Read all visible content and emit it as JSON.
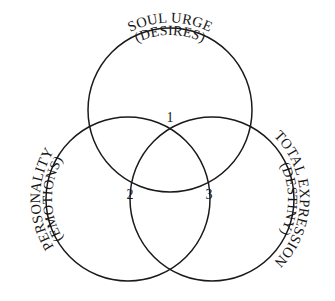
{
  "figure": {
    "background_color": "#ffffff",
    "stroke_color": "#1a1a1a",
    "text_color": "#161616"
  },
  "circles": [
    {
      "id": "soul-urge",
      "label_main": "SOUL URGE",
      "label_sub": "(DESIRES)",
      "position": "top",
      "cx": 170,
      "cy": 110,
      "r": 82
    },
    {
      "id": "personality",
      "label_main": "PERSONALITY",
      "label_sub": "(EMOTIONS)",
      "position": "bottom-left",
      "cx": 128,
      "cy": 199,
      "r": 82
    },
    {
      "id": "total-expression",
      "label_main": "TOTAL EXPRESSION",
      "label_sub": "(DESTINY)",
      "position": "bottom-right",
      "cx": 212,
      "cy": 199,
      "r": 82
    }
  ],
  "regions": [
    {
      "id": "region-1",
      "number": "1",
      "x": 170,
      "y": 122
    },
    {
      "id": "region-2",
      "number": "2",
      "x": 130,
      "y": 199
    },
    {
      "id": "region-3",
      "number": "3",
      "x": 209,
      "y": 199
    }
  ]
}
